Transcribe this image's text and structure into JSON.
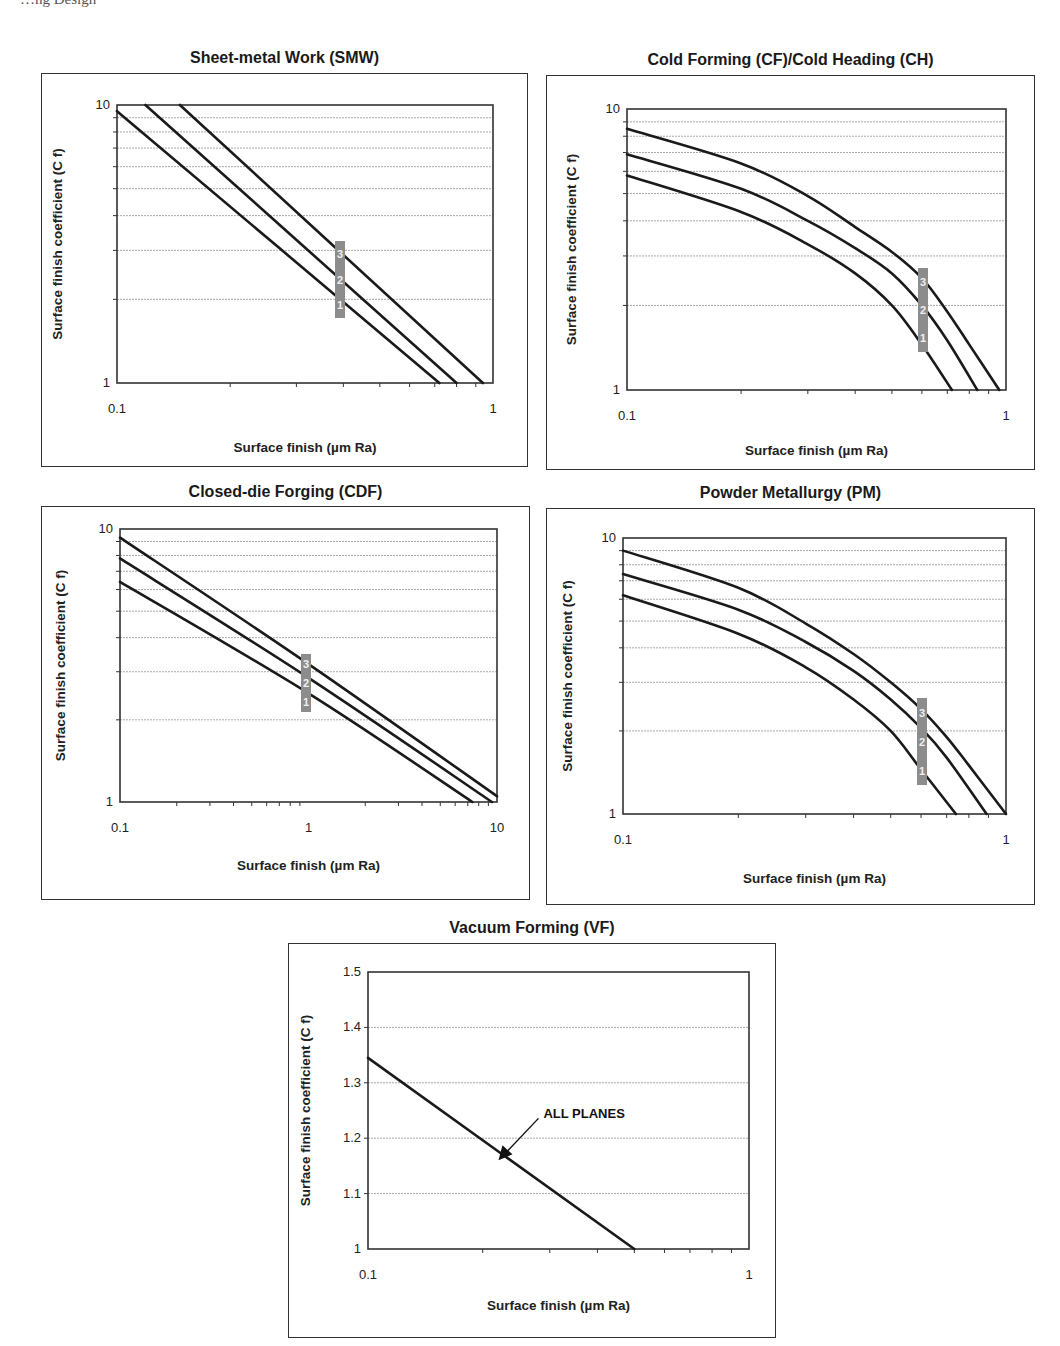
{
  "page": {
    "header_fragment": "…ng Design"
  },
  "charts": [
    {
      "id": "smw",
      "title": "Sheet-metal Work (SMW)",
      "xlabel": "Surface finish (µm Ra)",
      "ylabel": "Surface finish coefficient (C f)",
      "xticks": [
        "0.1",
        "1"
      ],
      "yticks": [
        "1",
        "10"
      ],
      "curve_labels": [
        "1",
        "2",
        "3"
      ]
    },
    {
      "id": "cf",
      "title": "Cold Forming (CF)/Cold Heading (CH)",
      "xlabel": "Surface finish (µm Ra)",
      "ylabel": "Surface finish coefficient (C f)",
      "xticks": [
        "0.1",
        "1"
      ],
      "yticks": [
        "1",
        "10"
      ],
      "curve_labels": [
        "1",
        "2",
        "3"
      ]
    },
    {
      "id": "cdf",
      "title": "Closed-die Forging (CDF)",
      "xlabel": "Surface finish (µm Ra)",
      "ylabel": "Surface finish coefficient (C f)",
      "xticks": [
        "0.1",
        "1",
        "10"
      ],
      "yticks": [
        "1",
        "10"
      ],
      "curve_labels": [
        "1",
        "2",
        "3"
      ]
    },
    {
      "id": "pm",
      "title": "Powder Metallurgy (PM)",
      "xlabel": "Surface finish (µm Ra)",
      "ylabel": "Surface finish coefficient (C f)",
      "xticks": [
        "0.1",
        "1"
      ],
      "yticks": [
        "1",
        "10"
      ],
      "curve_labels": [
        "1",
        "2",
        "3"
      ]
    },
    {
      "id": "vf",
      "title": "Vacuum Forming (VF)",
      "xlabel": "Surface finish (µm Ra)",
      "ylabel": "Surface finish coefficient (C f)",
      "xticks": [
        "0.1",
        "1"
      ],
      "yticks": [
        "1",
        "1.1",
        "1.2",
        "1.3",
        "1.4",
        "1.5"
      ],
      "annotation": "ALL PLANES"
    }
  ],
  "colors": {
    "curve": "#1a1a1a",
    "grid": "#a8a8a8",
    "badge": "#8c8c8c",
    "frame": "#333333"
  },
  "chart_data": [
    {
      "type": "line",
      "title": "Sheet-metal Work (SMW)",
      "xlabel": "Surface finish (µm Ra)",
      "ylabel": "Surface finish coefficient (C f)",
      "xscale": "log",
      "yscale": "log",
      "xlim": [
        0.1,
        1
      ],
      "ylim": [
        1,
        10
      ],
      "grid": "horizontal minor gridlines",
      "series": [
        {
          "name": "1",
          "x": [
            0.1,
            0.72
          ],
          "y": [
            9.5,
            1.0
          ]
        },
        {
          "name": "2",
          "x": [
            0.119,
            0.8
          ],
          "y": [
            10.0,
            1.0
          ]
        },
        {
          "name": "3",
          "x": [
            0.147,
            0.94
          ],
          "y": [
            10.0,
            1.0
          ]
        }
      ]
    },
    {
      "type": "line",
      "title": "Cold Forming (CF)/Cold Heading (CH)",
      "xlabel": "Surface finish (µm Ra)",
      "ylabel": "Surface finish coefficient (C f)",
      "xscale": "log",
      "yscale": "log",
      "xlim": [
        0.1,
        1
      ],
      "ylim": [
        1,
        10
      ],
      "grid": "horizontal minor gridlines",
      "series": [
        {
          "name": "1",
          "x": [
            0.1,
            0.2,
            0.3,
            0.4,
            0.5,
            0.6,
            0.72
          ],
          "y": [
            5.8,
            4.3,
            3.3,
            2.6,
            2.0,
            1.45,
            1.0
          ]
        },
        {
          "name": "2",
          "x": [
            0.1,
            0.2,
            0.3,
            0.4,
            0.5,
            0.6,
            0.7,
            0.84
          ],
          "y": [
            6.9,
            5.2,
            4.0,
            3.2,
            2.6,
            2.0,
            1.5,
            1.0
          ]
        },
        {
          "name": "3",
          "x": [
            0.1,
            0.2,
            0.3,
            0.4,
            0.5,
            0.6,
            0.7,
            0.8,
            0.96
          ],
          "y": [
            8.5,
            6.4,
            4.9,
            3.8,
            3.1,
            2.5,
            1.9,
            1.45,
            1.0
          ]
        }
      ]
    },
    {
      "type": "line",
      "title": "Closed-die Forging (CDF)",
      "xlabel": "Surface finish (µm Ra)",
      "ylabel": "Surface finish coefficient (C f)",
      "xscale": "log",
      "yscale": "log",
      "xlim": [
        0.1,
        10
      ],
      "ylim": [
        1,
        10
      ],
      "grid": "horizontal minor gridlines",
      "series": [
        {
          "name": "1",
          "x": [
            0.1,
            1,
            7.4
          ],
          "y": [
            6.4,
            2.5,
            1.0
          ]
        },
        {
          "name": "2",
          "x": [
            0.1,
            1,
            9.4
          ],
          "y": [
            7.8,
            2.85,
            1.0
          ]
        },
        {
          "name": "3",
          "x": [
            0.1,
            1,
            10
          ],
          "y": [
            9.3,
            3.2,
            1.05
          ]
        }
      ]
    },
    {
      "type": "line",
      "title": "Powder Metallurgy (PM)",
      "xlabel": "Surface finish (µm Ra)",
      "ylabel": "Surface finish coefficient (C f)",
      "xscale": "log",
      "yscale": "log",
      "xlim": [
        0.1,
        1
      ],
      "ylim": [
        1,
        10
      ],
      "grid": "horizontal minor gridlines",
      "series": [
        {
          "name": "1",
          "x": [
            0.1,
            0.2,
            0.3,
            0.4,
            0.5,
            0.6,
            0.74
          ],
          "y": [
            6.2,
            4.5,
            3.4,
            2.6,
            2.0,
            1.45,
            1.0
          ]
        },
        {
          "name": "2",
          "x": [
            0.1,
            0.2,
            0.3,
            0.4,
            0.5,
            0.6,
            0.7,
            0.89
          ],
          "y": [
            7.4,
            5.5,
            4.2,
            3.3,
            2.6,
            2.05,
            1.6,
            1.0
          ]
        },
        {
          "name": "3",
          "x": [
            0.1,
            0.2,
            0.3,
            0.4,
            0.5,
            0.6,
            0.7,
            0.8,
            1.0
          ],
          "y": [
            9.0,
            6.6,
            4.9,
            3.8,
            3.0,
            2.4,
            1.9,
            1.5,
            1.0
          ]
        }
      ]
    },
    {
      "type": "line",
      "title": "Vacuum Forming (VF)",
      "xlabel": "Surface finish (µm Ra)",
      "ylabel": "Surface finish coefficient (C f)",
      "xscale": "log",
      "yscale": "linear",
      "xlim": [
        0.1,
        1
      ],
      "ylim": [
        1,
        1.5
      ],
      "grid": "horizontal gridlines at 0.1",
      "annotations": [
        {
          "text": "ALL PLANES",
          "arrow_to": [
            0.22,
            1.16
          ]
        }
      ],
      "series": [
        {
          "name": "ALL PLANES",
          "x": [
            0.1,
            0.5
          ],
          "y": [
            1.345,
            1.0
          ]
        }
      ]
    }
  ]
}
